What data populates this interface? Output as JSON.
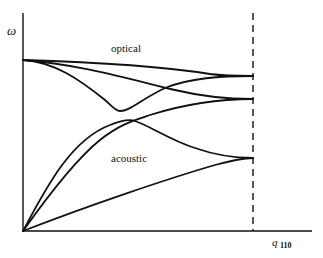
{
  "diagram": {
    "type": "phonon dispersion curves",
    "y_axis_label": "ω",
    "x_axis_label": "q",
    "x_axis_subscript": "110",
    "branch_labels": {
      "optical": "optical",
      "acoustic": "acoustic"
    },
    "zone_boundary": "dashed vertical line",
    "colors": {
      "line": "#111111",
      "background": "#ffffff"
    }
  }
}
